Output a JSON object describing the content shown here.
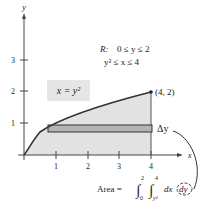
{
  "diagram": {
    "axes": {
      "x_label": "x",
      "y_label": "y",
      "x_ticks": [
        "1",
        "2",
        "3",
        "4"
      ],
      "y_ticks": [
        "1",
        "2",
        "3"
      ]
    },
    "region_definition": {
      "label": "R:",
      "line1": "0 ≤ y ≤ 2",
      "line2": "y² ≤ x ≤ 4"
    },
    "curve_label": "x = y²",
    "point_label": "(4, 2)",
    "delta_label": "Δy",
    "area_formula": {
      "prefix": "Area =",
      "outer_lower": "0",
      "outer_upper": "2",
      "inner_lower": "y²",
      "inner_upper": "4",
      "integrand": "dx",
      "circled_differential": "dy"
    },
    "colors": {
      "region_fill": "#e2e2e2",
      "rect_fill": "#b4b4b4",
      "curve": "#333333",
      "axis": "#444444",
      "label_box": "#e6e6e6"
    }
  }
}
